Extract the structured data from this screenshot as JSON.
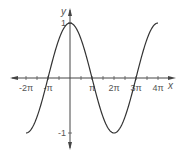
{
  "chart_data": {
    "type": "line",
    "title": "",
    "function": "y = cos(x/2)",
    "xlabel": "x",
    "ylabel": "y",
    "x_tick_labels": [
      "-2π",
      "-π",
      "π",
      "2π",
      "3π",
      "4π"
    ],
    "y_tick_labels": [
      "1",
      "-1"
    ],
    "xlim": [
      -6.283,
      12.566
    ],
    "ylim": [
      -1,
      1
    ],
    "grid": false,
    "legend": null,
    "series": [
      {
        "name": "cos(x/2)",
        "x": [
          -6.283,
          -3.142,
          0,
          3.142,
          6.283,
          9.425,
          12.566
        ],
        "values": [
          -1,
          0,
          1,
          0,
          -1,
          0,
          1
        ]
      }
    ],
    "colors": {
      "curve": "#333333",
      "axes": "#444444",
      "labels": "#555555"
    }
  }
}
